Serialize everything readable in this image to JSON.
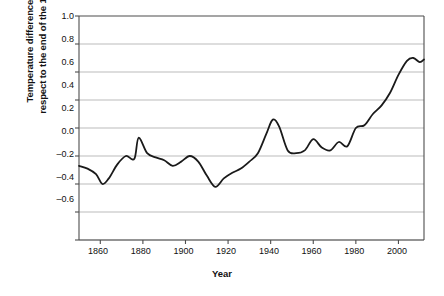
{
  "chart_data": {
    "type": "line",
    "title": "",
    "xlabel": "Year",
    "ylabel_line1": "Temperature difference (°C) with",
    "ylabel_line2": "respect to the end of the 19th century",
    "xlim": [
      1850,
      2012
    ],
    "ylim": [
      -0.6,
      1.0
    ],
    "xticks": [
      1860,
      1880,
      1900,
      1920,
      1940,
      1960,
      1980,
      2000
    ],
    "yticks": [
      1.0,
      0.8,
      0.6,
      0.4,
      0.2,
      0.0,
      -0.2,
      -0.4,
      -0.6
    ],
    "ytick_labels": [
      "1.0",
      "0.8",
      "0.6",
      "0.4",
      "0.2",
      "0.0",
      "–0.2",
      "–0.4",
      "–0.6"
    ],
    "xtick_labels": [
      "1860",
      "1880",
      "1900",
      "1920",
      "1940",
      "1960",
      "1980",
      "2000"
    ],
    "grid": true,
    "grid_color": "#b3b3b3",
    "line_color": "#1a1a1a",
    "line_width": 1.8,
    "legend": null,
    "series": [
      {
        "name": "Global temperature anomaly",
        "x": [
          1850,
          1854,
          1858,
          1861,
          1864,
          1868,
          1872,
          1876,
          1878,
          1882,
          1886,
          1890,
          1894,
          1898,
          1902,
          1906,
          1910,
          1914,
          1918,
          1922,
          1926,
          1930,
          1934,
          1938,
          1941,
          1944,
          1948,
          1952,
          1956,
          1960,
          1964,
          1968,
          1972,
          1976,
          1980,
          1984,
          1988,
          1992,
          1996,
          2000,
          2004,
          2007,
          2010,
          2012
        ],
        "values": [
          -0.07,
          -0.09,
          -0.13,
          -0.2,
          -0.16,
          -0.06,
          0.0,
          -0.02,
          0.13,
          0.02,
          -0.01,
          -0.03,
          -0.07,
          -0.04,
          0.0,
          -0.04,
          -0.14,
          -0.22,
          -0.16,
          -0.12,
          -0.09,
          -0.04,
          0.02,
          0.16,
          0.26,
          0.21,
          0.04,
          0.02,
          0.04,
          0.12,
          0.06,
          0.04,
          0.1,
          0.07,
          0.2,
          0.22,
          0.3,
          0.36,
          0.45,
          0.58,
          0.68,
          0.7,
          0.67,
          0.69
        ]
      }
    ]
  }
}
